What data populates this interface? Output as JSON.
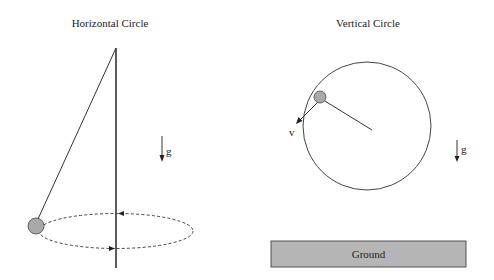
{
  "colors": {
    "stroke": "#333333",
    "ball_fill": "#a9a9a9",
    "ground_fill": "#b5b5b5",
    "background": "#ffffff"
  },
  "left_panel": {
    "title": "Horizontal Circle",
    "gravity_label": "g",
    "elements": [
      "pivot",
      "vertical-axis",
      "string",
      "ball",
      "dashed-circular-path",
      "direction-arrow-top-left",
      "direction-arrow-bottom-right",
      "gravity-arrow"
    ]
  },
  "right_panel": {
    "title": "Vertical Circle",
    "velocity_label": "v",
    "gravity_label": "g",
    "ground_label": "Ground",
    "elements": [
      "circular-path",
      "ball",
      "radius-line",
      "velocity-arrow",
      "gravity-arrow",
      "ground-block"
    ]
  }
}
